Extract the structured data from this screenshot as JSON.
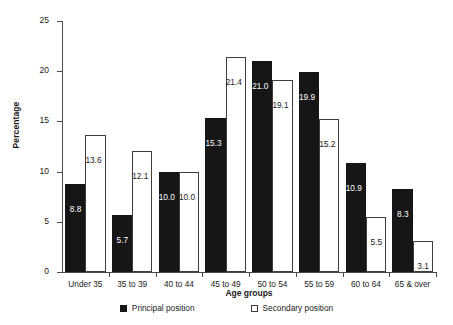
{
  "chart_data": {
    "type": "bar",
    "title": "",
    "xlabel": "Age groups",
    "ylabel": "Percentage",
    "ylim": [
      0,
      25
    ],
    "yticks": [
      0,
      5,
      10,
      15,
      20,
      25
    ],
    "grid": false,
    "legend_position": "bottom",
    "categories": [
      "Under 35",
      "35 to 39",
      "40 to 44",
      "45 to 49",
      "50 to 54",
      "55 to 59",
      "60 to 64",
      "65 & over"
    ],
    "series": [
      {
        "name": "Principal position",
        "color": "#161616",
        "style": "filled",
        "values": [
          8.8,
          5.7,
          10.0,
          15.3,
          21.0,
          19.9,
          10.9,
          8.3
        ],
        "labels": [
          "8.8",
          "5.7",
          "10.0",
          "15.3",
          "21.0",
          "19.9",
          "10.9",
          "8.3"
        ]
      },
      {
        "name": "Secondary position",
        "color": "#ffffff",
        "style": "outline",
        "values": [
          13.6,
          12.1,
          10.0,
          21.4,
          19.1,
          15.2,
          5.5,
          3.1
        ],
        "labels": [
          "13.6",
          "12.1",
          "10.0",
          "21.4",
          "19.1",
          "15.2",
          "5.5",
          "3.1"
        ]
      }
    ]
  },
  "axis": {
    "y_tick_labels": [
      "0",
      "5",
      "10",
      "15",
      "20",
      "25"
    ]
  },
  "colors": {
    "principal": "#161616",
    "secondary_fill": "#ffffff",
    "secondary_stroke": "#3d3d3d",
    "axis": "#4a4a4a",
    "text": "#1a1a1a"
  }
}
